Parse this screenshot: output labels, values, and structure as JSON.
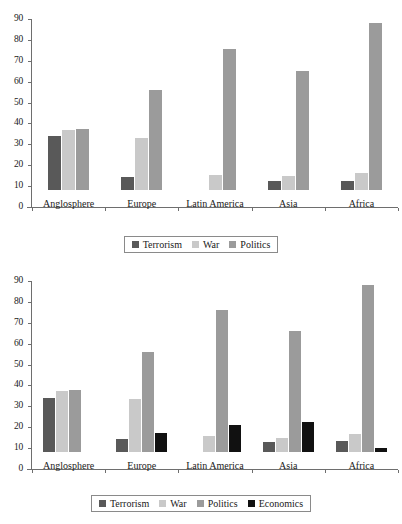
{
  "chart_data": [
    {
      "id": "chart-top",
      "type": "bar",
      "title": "",
      "subtitle": "",
      "xlabel": "",
      "ylabel": "",
      "ylim": [
        0,
        90
      ],
      "yticks": [
        0,
        10,
        20,
        30,
        40,
        50,
        60,
        70,
        80,
        90
      ],
      "ytick_labels": [
        "0",
        "10",
        "20",
        "30",
        "40",
        "50",
        "60",
        "70",
        "80",
        "90"
      ],
      "grid": false,
      "legend_position": "bottom",
      "categories": [
        "Anglosphere",
        "Europe",
        "Latin America",
        "Asia",
        "Africa"
      ],
      "series": [
        {
          "name": "Terrorism",
          "color": "#595959",
          "values": [
            26,
            6,
            0,
            4.5,
            4.5
          ]
        },
        {
          "name": "War",
          "color": "#c9c9c9",
          "values": [
            28.5,
            25,
            7,
            6.5,
            8
          ]
        },
        {
          "name": "Politics",
          "color": "#9b9b9b",
          "values": [
            29,
            48,
            67.5,
            57,
            80
          ]
        }
      ]
    },
    {
      "id": "chart-bottom",
      "type": "bar",
      "title": "",
      "subtitle": "",
      "xlabel": "",
      "ylabel": "",
      "ylim": [
        0,
        90
      ],
      "yticks": [
        0,
        10,
        20,
        30,
        40,
        50,
        60,
        70,
        80,
        90
      ],
      "ytick_labels": [
        "0",
        "10",
        "20",
        "30",
        "40",
        "50",
        "60",
        "70",
        "80",
        "90"
      ],
      "grid": false,
      "legend_position": "bottom",
      "categories": [
        "Anglosphere",
        "Europe",
        "Latin America",
        "Asia",
        "Africa"
      ],
      "series": [
        {
          "name": "Terrorism",
          "color": "#595959",
          "values": [
            26,
            6,
            0,
            5,
            5.5
          ]
        },
        {
          "name": "War",
          "color": "#c9c9c9",
          "values": [
            29,
            25.5,
            7.5,
            6.5,
            8.5
          ]
        },
        {
          "name": "Politics",
          "color": "#9b9b9b",
          "values": [
            29.5,
            48,
            68,
            58,
            80
          ]
        },
        {
          "name": "Economics",
          "color": "#111111",
          "values": [
            0,
            9,
            13,
            14.5,
            2
          ]
        }
      ]
    }
  ]
}
